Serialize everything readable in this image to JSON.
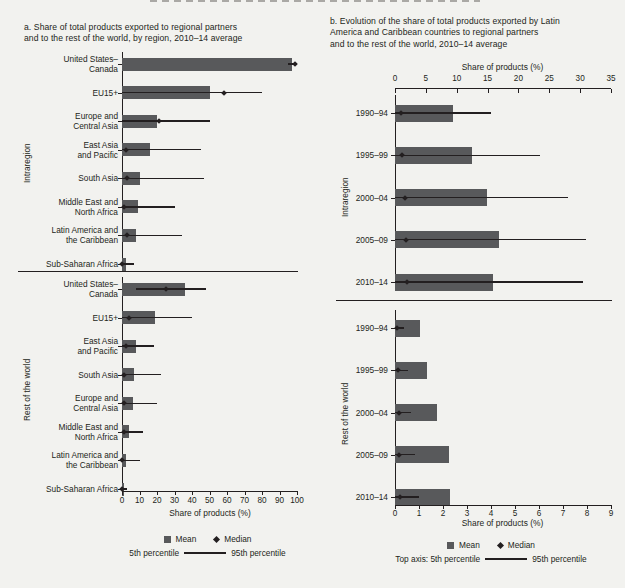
{
  "figure": {
    "background": "#f2f2ef",
    "bar_color": "#58595b",
    "ink_color": "#231f20"
  },
  "panel_a": {
    "title": "a. Share of total products exported to regional partners and to the rest of the world, by region, 2010–14 average",
    "title_line1": "a. Share of total products exported to regional partners",
    "title_line2": "and to the rest of the world, by region, 2010–14 average",
    "axis_title": "Share of products (%)",
    "group_labels": {
      "top": "Intraregion",
      "bottom": "Rest of the world"
    },
    "legend": {
      "mean": "Mean",
      "median": "Median",
      "p5": "5th percentile",
      "p95": "95th percentile"
    }
  },
  "panel_b": {
    "title": "b. Evolution of the share of total products exported by Latin America and Caribbean countries to regional partners and to the rest of the world, 2010–14 average",
    "title_line1": "b. Evolution of the share of total products exported by Latin",
    "title_line2": "America and Caribbean countries to regional partners",
    "title_line3": "and to the rest of the world, 2010–14 average",
    "top_axis_title": "Share of products (%)",
    "bottom_axis_title": "Share of products (%)",
    "group_labels": {
      "top": "Intraregion",
      "bottom": "Rest of the world"
    },
    "legend": {
      "mean": "Mean",
      "median": "Median",
      "p5": "Top axis: 5th percentile",
      "p95": "95th percentile"
    }
  },
  "chart_data": [
    {
      "type": "bar",
      "id": "panel-a",
      "orientation": "horizontal",
      "title": "a. Share of total products exported to regional partners and to the rest of the world, by region, 2010–14 average",
      "xlabel": "Share of products (%)",
      "ylabel": "",
      "xlim": [
        0,
        100
      ],
      "xticks": [
        0,
        10,
        20,
        30,
        40,
        50,
        60,
        70,
        80,
        90,
        100
      ],
      "grid": false,
      "legend": [
        "Mean",
        "Median",
        "5th percentile",
        "95th percentile"
      ],
      "groups": [
        {
          "name": "Intraregion",
          "items": [
            {
              "category": "United States–Canada",
              "label_line1": "United States–",
              "label_line2": "Canada",
              "mean": 97,
              "median": 99,
              "p5": 95,
              "p95": 100
            },
            {
              "category": "EU15+",
              "label_line1": "EU15+",
              "label_line2": "",
              "mean": 50,
              "median": 58,
              "p5": 0,
              "p95": 80
            },
            {
              "category": "Europe and Central Asia",
              "label_line1": "Europe and",
              "label_line2": "Central Asia",
              "mean": 20,
              "median": 21,
              "p5": 0,
              "p95": 50
            },
            {
              "category": "East Asia and Pacific",
              "label_line1": "East Asia",
              "label_line2": "and Pacific",
              "mean": 16,
              "median": 2,
              "p5": 0,
              "p95": 45
            },
            {
              "category": "South Asia",
              "label_line1": "South Asia",
              "label_line2": "",
              "mean": 10,
              "median": 3,
              "p5": 0,
              "p95": 47
            },
            {
              "category": "Middle East and North Africa",
              "label_line1": "Middle East and",
              "label_line2": "North Africa",
              "mean": 9,
              "median": 1,
              "p5": 0,
              "p95": 30
            },
            {
              "category": "Latin America and the Caribbean",
              "label_line1": "Latin America and",
              "label_line2": "the Caribbean",
              "mean": 8,
              "median": 3,
              "p5": 0,
              "p95": 34
            },
            {
              "category": "Sub-Saharan Africa",
              "label_line1": "Sub-Saharan Africa",
              "label_line2": "",
              "mean": 2,
              "median": 0,
              "p5": 0,
              "p95": 7
            }
          ]
        },
        {
          "name": "Rest of the world",
          "items": [
            {
              "category": "United States–Canada",
              "label_line1": "United States–",
              "label_line2": "Canada",
              "mean": 36,
              "median": 25,
              "p5": 8,
              "p95": 48
            },
            {
              "category": "EU15+",
              "label_line1": "EU15+",
              "label_line2": "",
              "mean": 19,
              "median": 4,
              "p5": 0,
              "p95": 40
            },
            {
              "category": "East Asia and Pacific",
              "label_line1": "East Asia",
              "label_line2": "and Pacific",
              "mean": 8,
              "median": 2,
              "p5": 0,
              "p95": 18
            },
            {
              "category": "South Asia",
              "label_line1": "South Asia",
              "label_line2": "",
              "mean": 7,
              "median": 1,
              "p5": 0,
              "p95": 22
            },
            {
              "category": "Europe and Central Asia",
              "label_line1": "Europe and",
              "label_line2": "Central Asia",
              "mean": 6,
              "median": 1,
              "p5": 0,
              "p95": 20
            },
            {
              "category": "Middle East and North Africa",
              "label_line1": "Middle East and",
              "label_line2": "North Africa",
              "mean": 4,
              "median": 1,
              "p5": 0,
              "p95": 12
            },
            {
              "category": "Latin America and the Caribbean",
              "label_line1": "Latin America and",
              "label_line2": "the Caribbean",
              "mean": 2,
              "median": 0,
              "p5": 0,
              "p95": 10
            },
            {
              "category": "Sub-Saharan Africa",
              "label_line1": "Sub-Saharan Africa",
              "label_line2": "",
              "mean": 1,
              "median": 0,
              "p5": 0,
              "p95": 3
            }
          ]
        }
      ]
    },
    {
      "type": "bar",
      "id": "panel-b",
      "orientation": "horizontal",
      "title": "b. Evolution of the share of total products exported by Latin America and Caribbean countries to regional partners and to the rest of the world, 2010–14 average",
      "top_xlabel": "Share of products (%)",
      "bottom_xlabel": "Share of products (%)",
      "top_xlim": [
        0,
        35
      ],
      "top_xticks": [
        0,
        5,
        10,
        15,
        20,
        25,
        30,
        35
      ],
      "bottom_xlim": [
        0,
        9
      ],
      "bottom_xticks": [
        0,
        1,
        2,
        3,
        4,
        5,
        6,
        7,
        8,
        9
      ],
      "grid": false,
      "legend": [
        "Mean",
        "Median",
        "Top axis: 5th percentile",
        "95th percentile"
      ],
      "groups": [
        {
          "name": "Intraregion",
          "axis": "bottom",
          "items": [
            {
              "category": "1990–94",
              "mean": 2.4,
              "median": 0.25,
              "p5_top": 0,
              "p95_top": 15.5
            },
            {
              "category": "1995–99",
              "mean": 3.2,
              "median": 0.3,
              "p5_top": 0,
              "p95_top": 23.5
            },
            {
              "category": "2000–04",
              "mean": 3.85,
              "median": 0.4,
              "p5_top": 0,
              "p95_top": 28.0
            },
            {
              "category": "2005–09",
              "mean": 4.35,
              "median": 0.45,
              "p5_top": 0,
              "p95_top": 31.0
            },
            {
              "category": "2010–14",
              "mean": 4.1,
              "median": 0.5,
              "p5_top": 0,
              "p95_top": 30.5
            }
          ]
        },
        {
          "name": "Rest of the world",
          "axis": "bottom",
          "items": [
            {
              "category": "1990–94",
              "mean": 1.05,
              "median": 0.1,
              "p5_top": 0,
              "p95_top": 1.45
            },
            {
              "category": "1995–99",
              "mean": 1.35,
              "median": 0.12,
              "p5_top": 0,
              "p95_top": 2.05
            },
            {
              "category": "2000–04",
              "mean": 1.75,
              "median": 0.15,
              "p5_top": 0,
              "p95_top": 2.6
            },
            {
              "category": "2005–09",
              "mean": 2.25,
              "median": 0.18,
              "p5_top": 0,
              "p95_top": 3.25
            },
            {
              "category": "2010–14",
              "mean": 2.3,
              "median": 0.2,
              "p5_top": 0,
              "p95_top": 3.85
            }
          ]
        }
      ]
    }
  ]
}
